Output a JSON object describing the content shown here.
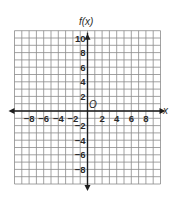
{
  "chart_data": {
    "type": "coordinate-grid",
    "title": "",
    "xlabel": "x",
    "ylabel": "f(x)",
    "origin_label": "O",
    "xlim": [
      -10,
      10
    ],
    "ylim": [
      -10,
      11
    ],
    "grid": true,
    "x_ticks": [
      -8,
      -6,
      -4,
      -2,
      2,
      4,
      6,
      8
    ],
    "x_tick_labels": [
      "−8",
      "−6",
      "−4",
      "−2",
      "2",
      "4",
      "6",
      "8"
    ],
    "y_ticks": [
      10,
      8,
      6,
      4,
      2,
      -2,
      -4,
      -6,
      -8
    ],
    "y_tick_labels": [
      "10",
      "8",
      "6",
      "4",
      "2",
      "−2",
      "−4",
      "−6",
      "−8"
    ],
    "series": []
  },
  "colors": {
    "grid": "#8a8a8a",
    "axis": "#1e1e1e",
    "text": "#2a2a2a",
    "background": "#ffffff"
  },
  "labels": {
    "y_axis": "f(x)",
    "x_axis": "x",
    "origin": "O"
  }
}
